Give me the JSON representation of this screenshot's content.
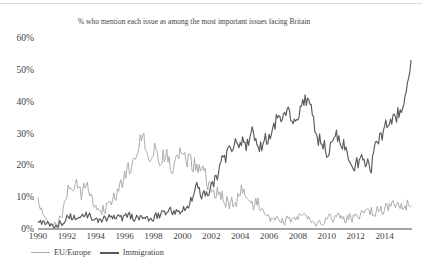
{
  "chart_data": {
    "type": "line",
    "title": "% who mention each issue as among the most important issues facing Britain",
    "xlabel": "",
    "ylabel": "",
    "xlim": [
      1990,
      2015.9
    ],
    "ylim": [
      0,
      60
    ],
    "grid": false,
    "legend_position": "bottom-left",
    "y_ticks": [
      "0%",
      "10%",
      "20%",
      "30%",
      "40%",
      "50%",
      "60%"
    ],
    "y_tick_values": [
      0,
      10,
      20,
      30,
      40,
      50,
      60
    ],
    "x_ticks": [
      "1990",
      "1992",
      "1994",
      "1996",
      "1998",
      "2000",
      "2002",
      "2004",
      "2006",
      "2008",
      "2010",
      "2012",
      "2014"
    ],
    "x_tick_values": [
      1990,
      1992,
      1994,
      1996,
      1998,
      2000,
      2002,
      2004,
      2006,
      2008,
      2010,
      2012,
      2014
    ],
    "series": [
      {
        "name": "EU/Europe",
        "color": "#a9a9a9",
        "noise": 4.1,
        "seed": 1733,
        "control_points": [
          [
            1990.0,
            8.0
          ],
          [
            1990.3,
            5.0
          ],
          [
            1990.7,
            3.5
          ],
          [
            1991.0,
            1.5
          ],
          [
            1991.4,
            2.0
          ],
          [
            1991.8,
            6.0
          ],
          [
            1992.1,
            12.0
          ],
          [
            1992.4,
            9.0
          ],
          [
            1992.7,
            14.0
          ],
          [
            1993.0,
            11.0
          ],
          [
            1993.4,
            13.0
          ],
          [
            1993.8,
            9.0
          ],
          [
            1994.2,
            7.0
          ],
          [
            1994.6,
            6.5
          ],
          [
            1995.0,
            9.0
          ],
          [
            1995.4,
            12.0
          ],
          [
            1995.8,
            15.0
          ],
          [
            1996.2,
            17.0
          ],
          [
            1996.6,
            20.0
          ],
          [
            1997.0,
            26.0
          ],
          [
            1997.25,
            32.0
          ],
          [
            1997.5,
            27.0
          ],
          [
            1997.8,
            24.0
          ],
          [
            1998.1,
            26.0
          ],
          [
            1998.5,
            22.0
          ],
          [
            1998.9,
            24.0
          ],
          [
            1999.3,
            20.0
          ],
          [
            1999.7,
            23.0
          ],
          [
            2000.1,
            25.0
          ],
          [
            2000.5,
            22.0
          ],
          [
            2000.9,
            20.0
          ],
          [
            2001.3,
            17.0
          ],
          [
            2001.7,
            15.0
          ],
          [
            2002.1,
            13.0
          ],
          [
            2002.5,
            11.0
          ],
          [
            2002.9,
            9.5
          ],
          [
            2003.3,
            8.0
          ],
          [
            2003.7,
            9.0
          ],
          [
            2004.1,
            12.0
          ],
          [
            2004.4,
            9.0
          ],
          [
            2004.8,
            7.0
          ],
          [
            2005.2,
            8.0
          ],
          [
            2005.6,
            6.0
          ],
          [
            2006.0,
            4.0
          ],
          [
            2006.5,
            3.0
          ],
          [
            2007.0,
            3.2
          ],
          [
            2007.5,
            3.0
          ],
          [
            2008.0,
            3.4
          ],
          [
            2008.5,
            3.2
          ],
          [
            2009.0,
            3.0
          ],
          [
            2009.5,
            2.6
          ],
          [
            2010.0,
            2.8
          ],
          [
            2010.5,
            3.0
          ],
          [
            2011.0,
            3.2
          ],
          [
            2011.5,
            3.6
          ],
          [
            2012.0,
            4.0
          ],
          [
            2012.5,
            4.4
          ],
          [
            2013.0,
            5.2
          ],
          [
            2013.5,
            6.0
          ],
          [
            2014.0,
            6.4
          ],
          [
            2014.5,
            7.0
          ],
          [
            2015.0,
            7.6
          ],
          [
            2015.5,
            8.2
          ],
          [
            2015.9,
            8.6
          ]
        ]
      },
      {
        "name": "Immigration",
        "color": "#5a5a5a",
        "noise": 3.2,
        "seed": 907,
        "control_points": [
          [
            1990.0,
            2.0
          ],
          [
            1990.5,
            1.6
          ],
          [
            1991.0,
            0.8
          ],
          [
            1991.5,
            1.8
          ],
          [
            1992.0,
            3.2
          ],
          [
            1992.5,
            4.0
          ],
          [
            1993.0,
            3.4
          ],
          [
            1993.5,
            4.2
          ],
          [
            1994.0,
            3.0
          ],
          [
            1994.5,
            3.4
          ],
          [
            1995.0,
            3.2
          ],
          [
            1995.5,
            3.6
          ],
          [
            1996.0,
            3.4
          ],
          [
            1996.5,
            3.8
          ],
          [
            1997.0,
            3.2
          ],
          [
            1997.5,
            3.0
          ],
          [
            1998.0,
            3.6
          ],
          [
            1998.5,
            4.4
          ],
          [
            1999.0,
            5.0
          ],
          [
            1999.5,
            5.6
          ],
          [
            2000.0,
            6.4
          ],
          [
            2000.4,
            8.0
          ],
          [
            2000.8,
            11.0
          ],
          [
            2001.1,
            13.5
          ],
          [
            2001.4,
            10.0
          ],
          [
            2001.8,
            12.0
          ],
          [
            2002.2,
            15.0
          ],
          [
            2002.6,
            19.0
          ],
          [
            2003.0,
            23.0
          ],
          [
            2003.3,
            28.0
          ],
          [
            2003.6,
            26.0
          ],
          [
            2004.0,
            29.0
          ],
          [
            2004.4,
            27.0
          ],
          [
            2004.8,
            30.0
          ],
          [
            2005.2,
            28.0
          ],
          [
            2005.6,
            26.0
          ],
          [
            2006.0,
            30.0
          ],
          [
            2006.4,
            33.0
          ],
          [
            2006.8,
            36.0
          ],
          [
            2007.1,
            38.0
          ],
          [
            2007.5,
            34.0
          ],
          [
            2007.9,
            36.0
          ],
          [
            2008.2,
            40.0
          ],
          [
            2008.5,
            41.0
          ],
          [
            2008.8,
            38.0
          ],
          [
            2009.1,
            33.0
          ],
          [
            2009.5,
            28.0
          ],
          [
            2009.9,
            25.0
          ],
          [
            2010.3,
            26.0
          ],
          [
            2010.7,
            28.0
          ],
          [
            2011.1,
            27.0
          ],
          [
            2011.5,
            24.0
          ],
          [
            2011.9,
            22.0
          ],
          [
            2012.3,
            21.0
          ],
          [
            2012.7,
            20.0
          ],
          [
            2013.1,
            21.0
          ],
          [
            2013.4,
            25.0
          ],
          [
            2013.8,
            30.0
          ],
          [
            2014.1,
            33.0
          ],
          [
            2014.5,
            35.0
          ],
          [
            2014.9,
            36.0
          ],
          [
            2015.2,
            38.0
          ],
          [
            2015.5,
            44.0
          ],
          [
            2015.75,
            50.0
          ],
          [
            2015.9,
            53.0
          ]
        ]
      }
    ]
  },
  "axis": {
    "line_color": "#4a4a4a"
  },
  "legend": {
    "items": [
      {
        "label": "EU/Europe",
        "color": "#a9a9a9",
        "width": 1.6
      },
      {
        "label": "Immigration",
        "color": "#5a5a5a",
        "width": 2.1
      }
    ]
  }
}
